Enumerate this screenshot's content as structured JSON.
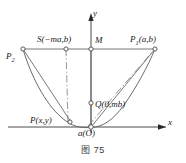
{
  "figure": {
    "caption": "图 75",
    "axes": {
      "x_label": "x",
      "y_label": "y"
    },
    "labels": {
      "p2": "P",
      "p2_sub": "2",
      "p1": "P",
      "p1_sub": "1",
      "p1_coords": "(a,b)",
      "s_point": "S(−ma,b)",
      "m_point": "M",
      "q_point": "Q(0,mb)",
      "p_point": "P(x,y)",
      "origin": "a(O)"
    },
    "colors": {
      "stroke": "#4a4a4a",
      "text": "#1a1a1a",
      "background": "#ffffff",
      "caption": "#3a3a3a"
    },
    "geometry": {
      "origin": [
        91,
        127
      ],
      "chord_y": 49,
      "p1": [
        155,
        49
      ],
      "p2": [
        23,
        49
      ],
      "s": [
        66,
        49
      ],
      "m": [
        91,
        49
      ],
      "q": [
        91,
        103
      ],
      "p": [
        71,
        122
      ],
      "x_axis_end": [
        173,
        127
      ],
      "y_axis_top": [
        91,
        14
      ]
    }
  }
}
